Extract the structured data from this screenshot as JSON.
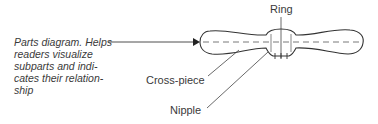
{
  "caption": {
    "lines": [
      "Parts diagram. Helps",
      "readers visualize",
      "subparts and indi-",
      "cates their relation-",
      "ship"
    ]
  },
  "labels": {
    "ring": "Ring",
    "cross_piece": "Cross-piece",
    "nipple": "Nipple"
  },
  "colors": {
    "ink": "#3a3a3a",
    "background": "#ffffff"
  }
}
